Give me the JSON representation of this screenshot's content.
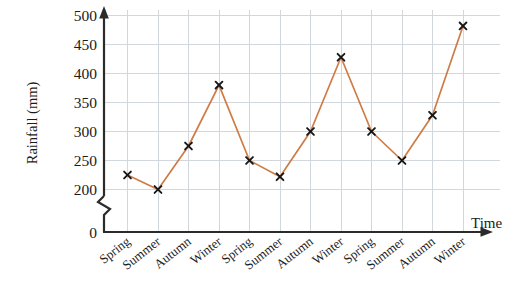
{
  "chart_data": {
    "type": "line",
    "title": "",
    "xlabel": "Time",
    "ylabel": "Rainfall (mm)",
    "categories": [
      "Spring",
      "Summer",
      "Autumn",
      "Winter",
      "Spring",
      "Summer",
      "Autumn",
      "Winter",
      "Spring",
      "Summer",
      "Autumn",
      "Winter"
    ],
    "values": [
      225,
      200,
      275,
      380,
      250,
      222,
      300,
      428,
      300,
      250,
      328,
      482
    ],
    "series": [
      {
        "name": "Rainfall",
        "values": [
          225,
          200,
          275,
          380,
          250,
          222,
          300,
          428,
          300,
          250,
          328,
          482
        ],
        "color": "#cf7b45",
        "marker": "x"
      }
    ],
    "ylim": [
      200,
      500
    ],
    "ytick_labels": [
      "500",
      "450",
      "400",
      "350",
      "300",
      "250",
      "200",
      "0"
    ],
    "ytick_values": [
      500,
      450,
      400,
      350,
      300,
      250,
      200,
      0
    ],
    "axis_break": true,
    "axis_break_note": "zig-zag break between 0 and 200 on the y-axis",
    "grid": true,
    "grid_color": "#d2d6dd",
    "legend": "none",
    "axis_color": "#2b2b2b",
    "marker_color": "#161616",
    "x_axis_arrow": true,
    "y_axis_arrow": true
  }
}
